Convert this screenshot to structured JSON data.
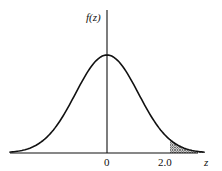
{
  "chart_data": {
    "type": "line",
    "ylabel": "f(z)",
    "xlabel": "z",
    "tick_labels": [
      "0",
      "2.0"
    ],
    "ticks": [
      0,
      2.0
    ],
    "shaded_region": {
      "from": 2.0,
      "to": "inf",
      "pattern": "crosshatch"
    },
    "curve": "standard normal pdf",
    "grid": false,
    "legend": null
  },
  "labels": {
    "y_axis": "f(z)",
    "x_axis": "z",
    "tick_zero": "0",
    "tick_two": "2.0"
  },
  "colors": {
    "line": "#111111",
    "background": "#ffffff"
  }
}
